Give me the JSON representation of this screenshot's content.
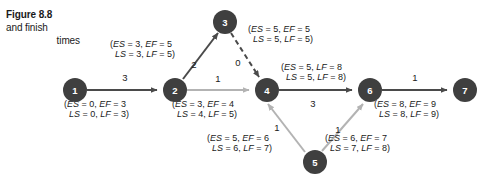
{
  "caption": {
    "title": "Figure 8.8",
    "line2": "and finish",
    "line3": "times"
  },
  "colors": {
    "node_fill": "#3f3f3f",
    "node_text": "#ffffff",
    "edge_dark": "#4a4a4a",
    "edge_light": "#b3b3b3",
    "text": "#1a1a1a",
    "background": "#ffffff"
  },
  "diagram": {
    "type": "activity-network-diagram",
    "nodes": [
      {
        "id": "1",
        "label": "1",
        "cx": 75,
        "cy": 90,
        "r": 12
      },
      {
        "id": "2",
        "label": "2",
        "cx": 175,
        "cy": 90,
        "r": 12
      },
      {
        "id": "3",
        "label": "3",
        "cx": 225,
        "cy": 22,
        "r": 12
      },
      {
        "id": "4",
        "label": "4",
        "cx": 267,
        "cy": 90,
        "r": 12
      },
      {
        "id": "5",
        "label": "5",
        "cx": 315,
        "cy": 162,
        "r": 12
      },
      {
        "id": "6",
        "label": "6",
        "cx": 370,
        "cy": 90,
        "r": 12
      },
      {
        "id": "7",
        "label": "7",
        "cx": 465,
        "cy": 90,
        "r": 12
      }
    ],
    "edges": [
      {
        "id": "e1-2",
        "from": "1",
        "to": "2",
        "duration": "3",
        "style": "solid-dark",
        "duration_x": 125,
        "duration_y": 81,
        "times_line1": "(ES = 0, EF = 3",
        "times_line2": "LS = 0, LF = 3)",
        "times_x": 64,
        "times_y": 107
      },
      {
        "id": "e2-3",
        "from": "2",
        "to": "3",
        "duration": "2",
        "style": "solid-dark",
        "duration_x": 194,
        "duration_y": 66,
        "times_line1": "(ES = 3, EF = 5",
        "times_line2": "LS = 3, LF = 5)",
        "times_x": 110,
        "times_y": 47
      },
      {
        "id": "e3-4",
        "from": "3",
        "to": "4",
        "duration": "0",
        "style": "dashed-dark",
        "duration_x": 239,
        "duration_y": 62,
        "times_line1": "(ES = 5, EF = 5",
        "times_line2": "LS = 5, LF = 5)",
        "times_x": 248,
        "times_y": 32
      },
      {
        "id": "e2-4",
        "from": "2",
        "to": "4",
        "duration": "1",
        "style": "solid-light",
        "duration_x": 218,
        "duration_y": 82,
        "times_line1": "(ES = 3, EF = 4",
        "times_line2": "LS = 4, LF = 5)",
        "times_x": 172,
        "times_y": 107
      },
      {
        "id": "e4-6",
        "from": "4",
        "to": "6",
        "duration": "3",
        "style": "solid-dark",
        "duration_x": 313,
        "duration_y": 106,
        "times_line1": "(ES = 5, LF = 8",
        "times_line2": "LS = 5, LF = 8)",
        "times_x": 281,
        "times_y": 70
      },
      {
        "id": "e4-5",
        "from": "4",
        "to": "5",
        "duration": "1",
        "style": "solid-light",
        "duration_x": 278,
        "duration_y": 129,
        "times_line1": "(ES = 5, EF = 6",
        "times_line2": "LS = 6, LF = 7)",
        "times_x": 207,
        "times_y": 141
      },
      {
        "id": "e5-6",
        "from": "5",
        "to": "6",
        "duration": "1",
        "style": "solid-light",
        "duration_x": 337,
        "duration_y": 131,
        "times_line1": "(ES = 6, EF = 7",
        "times_line2": "LS = 7, LF = 8)",
        "times_x": 325,
        "times_y": 141
      },
      {
        "id": "e6-7",
        "from": "6",
        "to": "7",
        "duration": "1",
        "style": "solid-dark",
        "duration_x": 415,
        "duration_y": 81,
        "times_line1": "(ES = 8, EF = 9",
        "times_line2": "LS = 8, LF = 9)",
        "times_x": 374,
        "times_y": 107
      }
    ]
  }
}
